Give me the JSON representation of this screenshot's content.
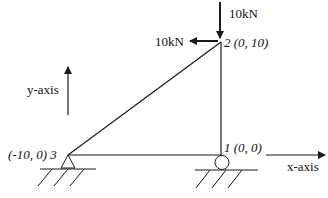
{
  "diagram": {
    "title": "",
    "colors": {
      "line": "#1a1a1a",
      "background": "#ffffff"
    },
    "nodes": [
      {
        "id": "1",
        "label": "1 (0, 0)",
        "coords": [
          0,
          0
        ],
        "support": "roller"
      },
      {
        "id": "2",
        "label": "2 (0, 10)",
        "coords": [
          0,
          10
        ],
        "support": "none"
      },
      {
        "id": "3",
        "label": "(-10, 0) 3",
        "coords": [
          -10,
          0
        ],
        "support": "pin"
      }
    ],
    "members": [
      {
        "from": "1",
        "to": "2"
      },
      {
        "from": "2",
        "to": "3"
      },
      {
        "from": "3",
        "to": "1"
      }
    ],
    "loads": [
      {
        "node": "2",
        "direction": "down",
        "label": "10kN"
      },
      {
        "node": "2",
        "direction": "left",
        "label": "10kN"
      }
    ],
    "axes": {
      "x_label": "x-axis",
      "y_label": "y-axis"
    }
  }
}
